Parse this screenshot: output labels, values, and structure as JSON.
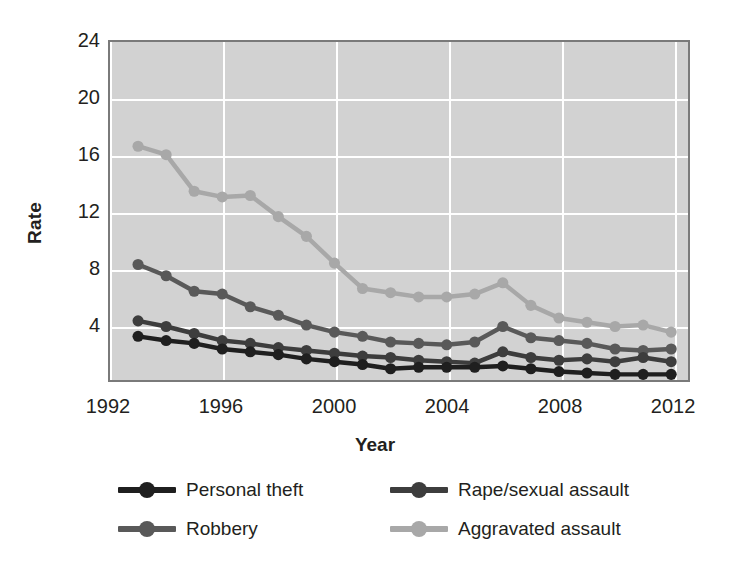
{
  "chart_data": {
    "type": "line",
    "title": "",
    "xlabel": "Year",
    "ylabel": "Rate",
    "xlim": [
      1992,
      2012.6
    ],
    "ylim": [
      0,
      24
    ],
    "grid": true,
    "legend_position": "bottom",
    "x_tick_labels": [
      "1992",
      "1996",
      "2000",
      "2004",
      "2008",
      "2012"
    ],
    "x_ticks": [
      1992,
      1996,
      2000,
      2004,
      2008,
      2012
    ],
    "y_tick_labels": [
      "4",
      "8",
      "12",
      "16",
      "20",
      "24"
    ],
    "y_ticks": [
      4,
      8,
      12,
      16,
      20,
      24
    ],
    "x": [
      1993,
      1994,
      1995,
      1996,
      1997,
      1998,
      1999,
      2000,
      2001,
      2002,
      2003,
      2004,
      2005,
      2006,
      2007,
      2008,
      2009,
      2010,
      2011,
      2012
    ],
    "series": [
      {
        "name": "Personal theft",
        "color": "#1f1f1f",
        "values": [
          3.1,
          2.8,
          2.6,
          2.2,
          2.0,
          1.8,
          1.5,
          1.3,
          1.1,
          0.8,
          0.9,
          0.9,
          0.9,
          1.0,
          0.8,
          0.6,
          0.5,
          0.4,
          0.4,
          0.4
        ]
      },
      {
        "name": "Robbery",
        "color": "#595959",
        "values": [
          8.2,
          7.4,
          6.3,
          6.1,
          5.2,
          4.6,
          3.9,
          3.4,
          3.1,
          2.7,
          2.6,
          2.5,
          2.7,
          3.8,
          3.0,
          2.8,
          2.6,
          2.2,
          2.1,
          2.2
        ]
      },
      {
        "name": "Rape/sexual assault",
        "color": "#3d3d3d",
        "values": [
          4.2,
          3.8,
          3.3,
          2.8,
          2.6,
          2.3,
          2.1,
          1.9,
          1.7,
          1.6,
          1.4,
          1.3,
          1.2,
          2.0,
          1.6,
          1.4,
          1.5,
          1.3,
          1.6,
          1.3
        ]
      },
      {
        "name": "Aggravated assault",
        "color": "#a8a8a8",
        "values": [
          16.6,
          16.0,
          13.4,
          13.0,
          13.1,
          11.6,
          10.2,
          8.3,
          6.5,
          6.2,
          5.9,
          5.9,
          6.1,
          6.9,
          5.3,
          4.4,
          4.1,
          3.8,
          3.9,
          3.4
        ]
      }
    ]
  },
  "axes": {
    "y_title": "Rate",
    "x_title": "Year"
  },
  "legend": {
    "items": [
      {
        "label": "Personal theft",
        "color": "#1f1f1f"
      },
      {
        "label": "Rape/sexual assault",
        "color": "#3d3d3d"
      },
      {
        "label": "Robbery",
        "color": "#595959"
      },
      {
        "label": "Aggravated assault",
        "color": "#a8a8a8"
      }
    ]
  },
  "colors": {
    "plot_background": "#d2d2d2",
    "gridline": "#ffffff",
    "plot_border": "#7a7a7a",
    "text": "#231f20",
    "page_background": "#ffffff"
  }
}
